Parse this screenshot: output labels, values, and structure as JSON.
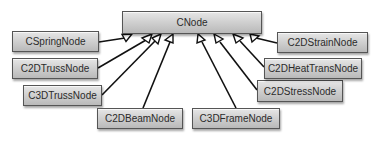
{
  "diagram": {
    "type": "uml-class-inheritance",
    "root": {
      "id": "cnode",
      "label": "CNode"
    },
    "children": [
      {
        "id": "cspringnode",
        "label": "CSpringNode"
      },
      {
        "id": "c2dtrussnode",
        "label": "C2DTrussNode"
      },
      {
        "id": "c3dtrussnode",
        "label": "C3DTrussNode"
      },
      {
        "id": "c2dbeamnode",
        "label": "C2DBeamNode"
      },
      {
        "id": "c3dframenode",
        "label": "C3DFrameNode"
      },
      {
        "id": "c2dstressnode",
        "label": "C2DStressNode"
      },
      {
        "id": "c2dheattransnode",
        "label": "C2DHeatTransNode"
      },
      {
        "id": "c2dstrainnode",
        "label": "C2DStrainNode"
      }
    ],
    "edges": [
      {
        "from": "CSpringNode",
        "to": "CNode",
        "arrow": "hollow-triangle"
      },
      {
        "from": "C2DTrussNode",
        "to": "CNode",
        "arrow": "hollow-triangle"
      },
      {
        "from": "C3DTrussNode",
        "to": "CNode",
        "arrow": "hollow-triangle"
      },
      {
        "from": "C2DBeamNode",
        "to": "CNode",
        "arrow": "hollow-triangle"
      },
      {
        "from": "C3DFrameNode",
        "to": "CNode",
        "arrow": "hollow-triangle"
      },
      {
        "from": "C2DStressNode",
        "to": "CNode",
        "arrow": "hollow-triangle"
      },
      {
        "from": "C2DHeatTransNode",
        "to": "CNode",
        "arrow": "hollow-triangle"
      },
      {
        "from": "C2DStrainNode",
        "to": "CNode",
        "arrow": "hollow-triangle"
      }
    ]
  },
  "colors": {
    "box_fill_top": "#e6e6e6",
    "box_fill_bottom": "#b9b9b9",
    "box_border": "#555555",
    "line": "#111111",
    "text": "#2b2b2b"
  }
}
